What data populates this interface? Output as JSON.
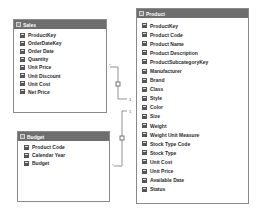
{
  "tables": {
    "sales": {
      "title": "Sales",
      "columns": [
        "ProductKey",
        "OrderDateKey",
        "Order Date",
        "Quantity",
        "Unit Price",
        "Unit Discount",
        "Unit Cost",
        "Net Price"
      ]
    },
    "budget": {
      "title": "Budget",
      "columns": [
        "Product Code",
        "Calendar Year",
        "Budget"
      ]
    },
    "product": {
      "title": "Product",
      "columns": [
        "ProductKey",
        "Product Code",
        "Product Name",
        "Product Description",
        "ProductSubcategoryKey",
        "Manufacturer",
        "Brand",
        "Class",
        "Style",
        "Color",
        "Size",
        "Weight",
        "Weight Unit Measure",
        "Stock Type Code",
        "Stock Type",
        "Unit Cost",
        "Unit Price",
        "Available Date",
        "Status"
      ]
    }
  },
  "relationships": [
    {
      "from": "Sales",
      "to": "Product",
      "from_card": "*",
      "to_card": "1"
    },
    {
      "from": "Budget",
      "to": "Product",
      "from_card": "*",
      "to_card": "1"
    }
  ],
  "colors": {
    "header_bg": "#6e6e6e",
    "border": "#8a8a8a",
    "connector": "#777777"
  }
}
